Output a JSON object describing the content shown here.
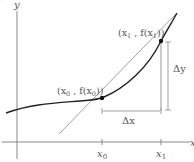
{
  "diagram": {
    "axes": {
      "x_label": "x",
      "y_label": "y"
    },
    "ticks": [
      {
        "id": "x0",
        "label": "x",
        "sub": "0"
      },
      {
        "id": "x1",
        "label": "x",
        "sub": "1"
      }
    ],
    "points": [
      {
        "id": "p0",
        "label_open": "(x",
        "sub": "0",
        "label_mid": " , f(x",
        "sub2": "0",
        "label_close": "))"
      },
      {
        "id": "p1",
        "label_open": "(x",
        "sub": "1",
        "label_mid": " , f(x",
        "sub2": "1",
        "label_close": "))"
      }
    ],
    "increments": {
      "dx": "Δx",
      "dy": "Δy"
    },
    "colors": {
      "curve": "#222222",
      "secant": "#9a9a9a",
      "axes": "#777777",
      "guides": "#8a8a8a",
      "point": "#111111"
    }
  }
}
